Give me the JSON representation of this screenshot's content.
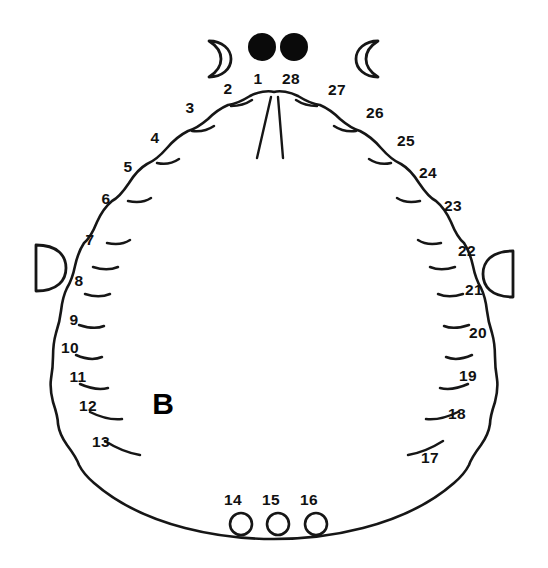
{
  "figure": {
    "panel_letter": "B",
    "background_color": "#ffffff",
    "ink_color": "#161616",
    "width": 548,
    "height": 568
  },
  "eyes": {
    "count": 2,
    "fill_color": "#0a0a0a",
    "left": {
      "cx": 262,
      "cy": 47,
      "r": 14
    },
    "right": {
      "cx": 294,
      "cy": 47,
      "r": 14
    }
  },
  "crescents": [
    {
      "name": "crescent-left",
      "cx": 216,
      "cy": 57,
      "orientation": "opens-left"
    },
    {
      "name": "crescent-right",
      "cx": 371,
      "cy": 57,
      "orientation": "opens-right"
    }
  ],
  "half_discs": [
    {
      "name": "half-disc-left",
      "cx": 43,
      "cy": 267,
      "orientation": "flat-left"
    },
    {
      "name": "half-disc-right",
      "cx": 505,
      "cy": 273,
      "orientation": "flat-right"
    }
  ],
  "posterior_circles": [
    {
      "label": "14",
      "cx": 241,
      "cy": 524,
      "r": 11
    },
    {
      "label": "15",
      "cx": 278,
      "cy": 524,
      "r": 11
    },
    {
      "label": "16",
      "cx": 316,
      "cy": 524,
      "r": 11
    }
  ],
  "lobe_labels": [
    {
      "label": "1",
      "x": 258,
      "y": 84
    },
    {
      "label": "2",
      "x": 228,
      "y": 94
    },
    {
      "label": "3",
      "x": 190,
      "y": 113
    },
    {
      "label": "4",
      "x": 155,
      "y": 143
    },
    {
      "label": "5",
      "x": 128,
      "y": 172
    },
    {
      "label": "6",
      "x": 106,
      "y": 204
    },
    {
      "label": "7",
      "x": 90,
      "y": 245
    },
    {
      "label": "8",
      "x": 79,
      "y": 286
    },
    {
      "label": "9",
      "x": 74,
      "y": 325
    },
    {
      "label": "10",
      "x": 70,
      "y": 353
    },
    {
      "label": "11",
      "x": 78,
      "y": 382
    },
    {
      "label": "12",
      "x": 88,
      "y": 411
    },
    {
      "label": "13",
      "x": 101,
      "y": 447
    },
    {
      "label": "14",
      "x": 233,
      "y": 505
    },
    {
      "label": "15",
      "x": 271,
      "y": 505
    },
    {
      "label": "16",
      "x": 309,
      "y": 505
    },
    {
      "label": "17",
      "x": 430,
      "y": 463
    },
    {
      "label": "18",
      "x": 457,
      "y": 419
    },
    {
      "label": "19",
      "x": 468,
      "y": 381
    },
    {
      "label": "20",
      "x": 478,
      "y": 338
    },
    {
      "label": "21",
      "x": 474,
      "y": 295
    },
    {
      "label": "22",
      "x": 467,
      "y": 256
    },
    {
      "label": "23",
      "x": 453,
      "y": 211
    },
    {
      "label": "24",
      "x": 428,
      "y": 178
    },
    {
      "label": "25",
      "x": 406,
      "y": 146
    },
    {
      "label": "26",
      "x": 375,
      "y": 118
    },
    {
      "label": "27",
      "x": 337,
      "y": 95
    },
    {
      "label": "28",
      "x": 291,
      "y": 84
    }
  ],
  "counts": {
    "total_numbered_lobes": 28,
    "posterior_circle_count": 3,
    "eye_count": 2,
    "crescent_count": 2,
    "half_disc_count": 2
  }
}
